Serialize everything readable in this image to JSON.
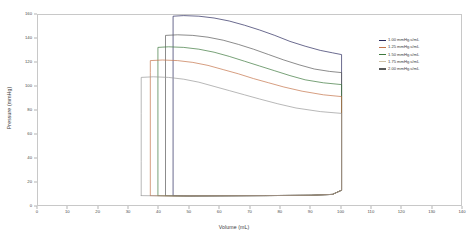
{
  "chart_data": {
    "type": "line",
    "title": "",
    "xlabel": "Volume (mL)",
    "ylabel": "Pressure (mmHg)",
    "xlim": [
      0,
      140
    ],
    "ylim": [
      0,
      160
    ],
    "xticks": [
      0,
      10,
      20,
      30,
      40,
      50,
      60,
      70,
      80,
      90,
      100,
      110,
      120,
      130,
      140
    ],
    "yticks": [
      0,
      20,
      40,
      60,
      80,
      100,
      120,
      140,
      160
    ],
    "grid": false,
    "legend_position": "right",
    "series": [
      {
        "name": "1.00 mmHg.s/mL",
        "color": "#2b2b5e",
        "esv": 44.5,
        "edv": 100.0,
        "peak_pressure": 159.0,
        "end_ejection_pressure": 127.0,
        "diastolic_pressure": 9.5,
        "points": [
          [
            44.5,
            9.5
          ],
          [
            44.5,
            40
          ],
          [
            44.5,
            90
          ],
          [
            44.5,
            130
          ],
          [
            44.5,
            159.0
          ],
          [
            48,
            159.5
          ],
          [
            53,
            159.0
          ],
          [
            58,
            157.5
          ],
          [
            63,
            155.0
          ],
          [
            68,
            151.5
          ],
          [
            73,
            147.5
          ],
          [
            78,
            143.0
          ],
          [
            83,
            138.0
          ],
          [
            88,
            134.0
          ],
          [
            93,
            130.5
          ],
          [
            97,
            128.5
          ],
          [
            100,
            127.0
          ],
          [
            100,
            95
          ],
          [
            100,
            50
          ],
          [
            100,
            14
          ],
          [
            97,
            10.5
          ],
          [
            90,
            9.8
          ],
          [
            75,
            9.5
          ],
          [
            60,
            9.3
          ],
          [
            50,
            9.2
          ],
          [
            44.5,
            9.5
          ]
        ]
      },
      {
        "name": "1.25 mmHg.s/mL",
        "color": "#5a5a5a",
        "esv": 42.0,
        "edv": 100.0,
        "peak_pressure": 143.0,
        "end_ejection_pressure": 112.0,
        "diastolic_pressure": 9.5,
        "points": [
          [
            42.0,
            9.5
          ],
          [
            42.0,
            40
          ],
          [
            42.0,
            90
          ],
          [
            42.0,
            125
          ],
          [
            42.0,
            143.0
          ],
          [
            46,
            143.5
          ],
          [
            51,
            143.0
          ],
          [
            56,
            141.5
          ],
          [
            61,
            139.0
          ],
          [
            66,
            135.5
          ],
          [
            71,
            131.5
          ],
          [
            76,
            127.0
          ],
          [
            81,
            122.5
          ],
          [
            86,
            118.5
          ],
          [
            91,
            115.0
          ],
          [
            96,
            113.0
          ],
          [
            100,
            112.0
          ],
          [
            100,
            80
          ],
          [
            100,
            45
          ],
          [
            100,
            14
          ],
          [
            97,
            10.5
          ],
          [
            90,
            9.8
          ],
          [
            75,
            9.5
          ],
          [
            58,
            9.3
          ],
          [
            48,
            9.2
          ],
          [
            42.0,
            9.5
          ]
        ]
      },
      {
        "name": "1.50 mmHg.s/mL",
        "color": "#3f7a3f",
        "esv": 39.5,
        "edv": 100.0,
        "peak_pressure": 133.0,
        "end_ejection_pressure": 102.0,
        "diastolic_pressure": 9.5,
        "points": [
          [
            39.5,
            9.5
          ],
          [
            39.5,
            40
          ],
          [
            39.5,
            90
          ],
          [
            39.5,
            120
          ],
          [
            39.5,
            133.0
          ],
          [
            43,
            133.5
          ],
          [
            48,
            133.0
          ],
          [
            53,
            131.5
          ],
          [
            58,
            129.0
          ],
          [
            63,
            125.5
          ],
          [
            68,
            121.5
          ],
          [
            73,
            117.5
          ],
          [
            78,
            113.5
          ],
          [
            83,
            109.5
          ],
          [
            88,
            106.0
          ],
          [
            94,
            103.5
          ],
          [
            100,
            102.0
          ],
          [
            100,
            70
          ],
          [
            100,
            40
          ],
          [
            100,
            14
          ],
          [
            97,
            10.5
          ],
          [
            90,
            9.8
          ],
          [
            75,
            9.5
          ],
          [
            56,
            9.3
          ],
          [
            46,
            9.2
          ],
          [
            39.5,
            9.5
          ]
        ]
      },
      {
        "name": "1.75 mmHg.s/mL",
        "color": "#c4744a",
        "esv": 37.0,
        "edv": 100.0,
        "peak_pressure": 122.0,
        "end_ejection_pressure": 92.0,
        "diastolic_pressure": 9.5,
        "points": [
          [
            37.0,
            9.5
          ],
          [
            37.0,
            40
          ],
          [
            37.0,
            85
          ],
          [
            37.0,
            112
          ],
          [
            37.0,
            122.0
          ],
          [
            41,
            122.5
          ],
          [
            46,
            122.0
          ],
          [
            51,
            120.5
          ],
          [
            56,
            118.0
          ],
          [
            61,
            114.5
          ],
          [
            66,
            111.0
          ],
          [
            71,
            107.0
          ],
          [
            76,
            103.5
          ],
          [
            81,
            100.0
          ],
          [
            87,
            96.5
          ],
          [
            94,
            93.5
          ],
          [
            100,
            92.0
          ],
          [
            100,
            62
          ],
          [
            100,
            35
          ],
          [
            100,
            14
          ],
          [
            97,
            10.5
          ],
          [
            90,
            9.8
          ],
          [
            75,
            9.5
          ],
          [
            54,
            9.3
          ],
          [
            44,
            9.2
          ],
          [
            37.0,
            9.5
          ]
        ]
      },
      {
        "name": "2.00 mmHg.s/mL",
        "color": "#9a9a9a",
        "esv": 34.0,
        "edv": 100.0,
        "peak_pressure": 108.0,
        "end_ejection_pressure": 78.0,
        "diastolic_pressure": 9.5,
        "points": [
          [
            34.0,
            9.5
          ],
          [
            34.0,
            38
          ],
          [
            34.0,
            78
          ],
          [
            34.0,
            100
          ],
          [
            34.0,
            108.0
          ],
          [
            38,
            108.5
          ],
          [
            43,
            108.0
          ],
          [
            48,
            106.5
          ],
          [
            53,
            104.0
          ],
          [
            58,
            100.5
          ],
          [
            63,
            97.0
          ],
          [
            68,
            93.5
          ],
          [
            73,
            90.0
          ],
          [
            79,
            86.0
          ],
          [
            85,
            82.5
          ],
          [
            93,
            79.5
          ],
          [
            100,
            78.0
          ],
          [
            100,
            55
          ],
          [
            100,
            30
          ],
          [
            100,
            14
          ],
          [
            97,
            10.5
          ],
          [
            90,
            9.8
          ],
          [
            75,
            9.5
          ],
          [
            52,
            9.3
          ],
          [
            42,
            9.2
          ],
          [
            34.0,
            9.5
          ]
        ]
      }
    ]
  },
  "axes": {
    "y_title": "Pressure (mmHg)",
    "x_title": "Volume (mL)"
  },
  "legend": {
    "entries": [
      {
        "label": "1.00 mmHg.s/mL",
        "color": "#2b2b5e"
      },
      {
        "label": "1.25 mmHg.s/mL",
        "color": "#c4744a"
      },
      {
        "label": "1.50 mmHg.s/mL",
        "color": "#3f7a3f"
      },
      {
        "label": "1.75 mmHg.s/mL",
        "color": "#cfc2a8"
      },
      {
        "label": "2.00 mmHg.s/mL",
        "color": "#5a5a5a"
      }
    ]
  }
}
